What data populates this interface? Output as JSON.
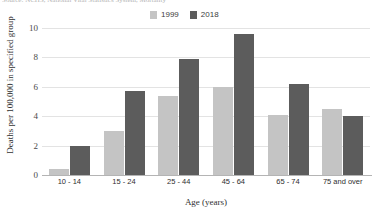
{
  "source_note": "Source: NCHS, National Vital Statistics System, Mortality",
  "legend": {
    "position": "top-center",
    "entries": [
      {
        "label": "1999",
        "color": "#c4c4c4"
      },
      {
        "label": "2018",
        "color": "#5c5c5c"
      }
    ]
  },
  "chart_data": {
    "type": "bar",
    "title": "",
    "subtitle": "",
    "xlabel": "Age (years)",
    "ylabel": "Deaths per 100,000 in specified group",
    "categories": [
      "10 - 14",
      "15 - 24",
      "25 - 44",
      "45 - 64",
      "65 - 74",
      "75 and over"
    ],
    "series": [
      {
        "name": "1999",
        "color": "#c4c4c4",
        "values": [
          0.4,
          3.0,
          5.4,
          6.0,
          4.1,
          4.5
        ]
      },
      {
        "name": "2018",
        "color": "#5c5c5c",
        "values": [
          2.0,
          5.7,
          7.9,
          9.6,
          6.2,
          4.0
        ]
      }
    ],
    "ylim": [
      0,
      10
    ],
    "yticks": [
      0,
      2,
      4,
      6,
      8,
      10
    ],
    "ytick_labels": [
      "0",
      "2",
      "4",
      "6",
      "8",
      "10"
    ],
    "grid": true,
    "grid_axis": "y",
    "legend_position": "top-center",
    "bar_orientation": "vertical",
    "grouped": true
  },
  "colors": {
    "gridline": "#e3e3e3",
    "axis": "#b4b4b4",
    "text": "#303030",
    "background": "#ffffff"
  }
}
